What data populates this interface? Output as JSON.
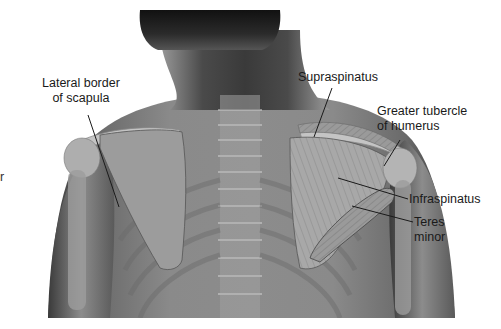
{
  "figure": {
    "labels": [
      {
        "id": "lateral-border-of-scapula",
        "line1": "Lateral border",
        "line2": "of scapula"
      },
      {
        "id": "supraspinatus",
        "line1": "Supraspinatus"
      },
      {
        "id": "greater-tubercle-of-humerus",
        "line1": "Greater tubercle",
        "line2": "of humerus"
      },
      {
        "id": "infraspinatus",
        "line1": "Infraspinatus"
      },
      {
        "id": "teres-minor",
        "line1": "Teres",
        "line2": "minor"
      }
    ],
    "clipped_label_fragment": "r"
  },
  "colors": {
    "background": "#ffffff",
    "skin_dark": "#2a2a2a",
    "skin_mid": "#6e6e6e",
    "bone": "#b8b8b8",
    "muscle": "#9a9a9a",
    "leader_line": "#1a1a1a",
    "text": "#1a1a1a"
  }
}
